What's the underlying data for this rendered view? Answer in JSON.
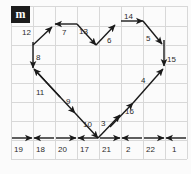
{
  "diagram": {
    "title_logo": "m",
    "type": "heart-shape-vector-path-on-grid",
    "background_color": "#fbfbfb",
    "grid_line_color": "#d8d8d8",
    "arrow_color": "#1a1a1a",
    "label_color": "#2b2b2b",
    "grid": {
      "cols": 8,
      "rows": 7,
      "x_lines": [
        11,
        33,
        55,
        77,
        99,
        121,
        143,
        165,
        187
      ],
      "y_lines": [
        6,
        26,
        45,
        64,
        83,
        102,
        121,
        140,
        159
      ]
    },
    "segments": [
      {
        "id": "seg-12",
        "label": "12",
        "direction": "up-right",
        "x1": 33,
        "y1": 45,
        "x2": 52,
        "y2": 27,
        "label_x": 22,
        "label_y": 29
      },
      {
        "id": "seg-7",
        "label": "7",
        "direction": "left",
        "x1": 77,
        "y1": 24,
        "x2": 55,
        "y2": 24,
        "label_x": 62,
        "label_y": 29
      },
      {
        "id": "seg-13",
        "label": "13",
        "direction": "down-right",
        "x1": 77,
        "y1": 24,
        "x2": 96,
        "y2": 45,
        "label_x": 79,
        "label_y": 28
      },
      {
        "id": "seg-6",
        "label": "6",
        "direction": "up-right",
        "x1": 96,
        "y1": 45,
        "x2": 115,
        "y2": 25,
        "label_x": 107,
        "label_y": 37
      },
      {
        "id": "seg-14",
        "label": "14",
        "direction": "right",
        "x1": 121,
        "y1": 21,
        "x2": 143,
        "y2": 21,
        "label_x": 124,
        "label_y": 13
      },
      {
        "id": "seg-5",
        "label": "5",
        "direction": "down-right",
        "x1": 143,
        "y1": 21,
        "x2": 162,
        "y2": 44,
        "label_x": 146,
        "label_y": 35
      },
      {
        "id": "seg-15",
        "label": "15",
        "direction": "down",
        "x1": 164,
        "y1": 40,
        "x2": 164,
        "y2": 66,
        "label_x": 167,
        "label_y": 56
      },
      {
        "id": "seg-8",
        "label": "8",
        "direction": "down",
        "x1": 33,
        "y1": 42,
        "x2": 33,
        "y2": 68,
        "label_x": 36,
        "label_y": 54
      },
      {
        "id": "seg-11",
        "label": "11",
        "direction": "up-left",
        "x1": 60,
        "y1": 97,
        "x2": 34,
        "y2": 69,
        "label_x": 36,
        "label_y": 89
      },
      {
        "id": "seg-9",
        "label": "9",
        "direction": "down-right",
        "x1": 35,
        "y1": 70,
        "x2": 75,
        "y2": 113,
        "label_x": 66,
        "label_y": 98
      },
      {
        "id": "seg-10",
        "label": "10",
        "direction": "down-right",
        "x1": 75,
        "y1": 113,
        "x2": 98,
        "y2": 138,
        "label_x": 83,
        "label_y": 121
      },
      {
        "id": "seg-3",
        "label": "3",
        "direction": "up-right",
        "x1": 98,
        "y1": 138,
        "x2": 120,
        "y2": 115,
        "label_x": 101,
        "label_y": 120
      },
      {
        "id": "seg-16",
        "label": "16",
        "direction": "up-right",
        "x1": 110,
        "y1": 127,
        "x2": 133,
        "y2": 103,
        "label_x": 125,
        "label_y": 108
      },
      {
        "id": "seg-4",
        "label": "4",
        "direction": "up-right",
        "x1": 133,
        "y1": 103,
        "x2": 163,
        "y2": 69,
        "label_x": 141,
        "label_y": 77
      },
      {
        "id": "seg-19",
        "label": "19",
        "direction": "right",
        "x1": 12,
        "y1": 138,
        "x2": 32,
        "y2": 138,
        "label_x": 14,
        "label_y": 146
      },
      {
        "id": "seg-18",
        "label": "18",
        "direction": "left",
        "x1": 54,
        "y1": 138,
        "x2": 34,
        "y2": 138,
        "label_x": 36,
        "label_y": 146
      },
      {
        "id": "seg-20",
        "label": "20",
        "direction": "right",
        "x1": 56,
        "y1": 138,
        "x2": 76,
        "y2": 138,
        "label_x": 58,
        "label_y": 146
      },
      {
        "id": "seg-17",
        "label": "17",
        "direction": "left",
        "x1": 98,
        "y1": 138,
        "x2": 78,
        "y2": 138,
        "label_x": 80,
        "label_y": 146
      },
      {
        "id": "seg-21",
        "label": "21",
        "direction": "right",
        "x1": 100,
        "y1": 138,
        "x2": 120,
        "y2": 138,
        "label_x": 102,
        "label_y": 146
      },
      {
        "id": "seg-2",
        "label": "2",
        "direction": "left",
        "x1": 142,
        "y1": 138,
        "x2": 122,
        "y2": 138,
        "label_x": 126,
        "label_y": 146
      },
      {
        "id": "seg-22",
        "label": "22",
        "direction": "right",
        "x1": 144,
        "y1": 138,
        "x2": 164,
        "y2": 138,
        "label_x": 146,
        "label_y": 146
      },
      {
        "id": "seg-1",
        "label": "1",
        "direction": "left",
        "x1": 186,
        "y1": 138,
        "x2": 166,
        "y2": 138,
        "label_x": 172,
        "label_y": 146
      }
    ]
  }
}
